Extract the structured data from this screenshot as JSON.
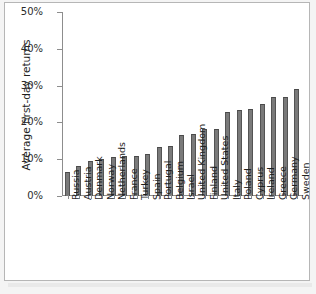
{
  "chart_data": {
    "type": "bar",
    "title": "",
    "subtitle": "",
    "xlabel": "",
    "ylabel": "Average first-day returns",
    "ylim": [
      0,
      50
    ],
    "yticks": [
      "0%",
      "10%",
      "20%",
      "30%",
      "40%",
      "50%"
    ],
    "ytick_values": [
      0,
      10,
      20,
      30,
      40,
      50
    ],
    "grid": false,
    "legend": null,
    "bar_color": "#7a7a7a",
    "categories": [
      "Russia",
      "Austria",
      "Denmark",
      "Norway",
      "Netherlands",
      "France",
      "Turkey",
      "Spain",
      "Portugal",
      "Belgium",
      "Israel",
      "United Kingdom",
      "Finland",
      "United States",
      "Italy",
      "Poland",
      "Cyprus",
      "Ireland",
      "Greece",
      "Germany",
      "Sweden"
    ],
    "values": [
      6.4,
      8.1,
      9.5,
      10.1,
      10.5,
      10.8,
      10.8,
      11.4,
      13.4,
      13.6,
      16.6,
      16.9,
      18.1,
      18.2,
      22.8,
      23.5,
      23.6,
      24.9,
      26.8,
      27.0,
      29.1
    ],
    "value_unit": "%"
  }
}
